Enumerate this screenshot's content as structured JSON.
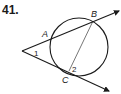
{
  "problem": {
    "number": "41."
  },
  "diagram": {
    "points": {
      "A": "A",
      "B": "B",
      "C": "C"
    },
    "angles": {
      "angle1": "1",
      "angle2": "2"
    },
    "colors": {
      "stroke": "#1a1a1a",
      "background": "#ffffff"
    }
  }
}
